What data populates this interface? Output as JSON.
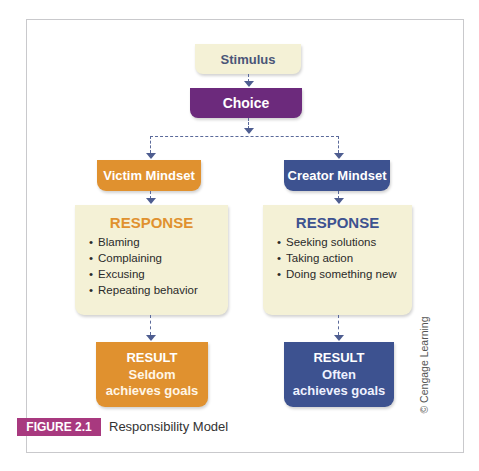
{
  "diagram": {
    "title": "Responsibility Model",
    "figure_label": "FIGURE 2.1",
    "copyright": "© Cengage Learning",
    "nodes": {
      "stimulus": "Stimulus",
      "choice": "Choice",
      "victim_mindset": "Victim Mindset",
      "creator_mindset": "Creator Mindset"
    },
    "victim": {
      "response_title": "RESPONSE",
      "responses": [
        "Blaming",
        "Complaining",
        "Excusing",
        "Repeating behavior"
      ],
      "result_title": "RESULT",
      "result_line1": "Seldom",
      "result_line2": "achieves goals"
    },
    "creator": {
      "response_title": "RESPONSE",
      "responses": [
        "Seeking solutions",
        "Taking action",
        "Doing something new"
      ],
      "result_title": "RESULT",
      "result_line1": "Often",
      "result_line2": "achieves goals"
    },
    "colors": {
      "stimulus_bg": "#f4f1d6",
      "choice_bg": "#6c2a7c",
      "victim": "#e0912f",
      "creator": "#3d5290",
      "response_bg": "#f4f1d6",
      "figure_badge": "#a8397f",
      "connector": "#5b6a9a"
    },
    "edges": [
      [
        "Stimulus",
        "Choice"
      ],
      [
        "Choice",
        "Victim Mindset"
      ],
      [
        "Choice",
        "Creator Mindset"
      ],
      [
        "Victim Mindset",
        "Victim Response"
      ],
      [
        "Creator Mindset",
        "Creator Response"
      ],
      [
        "Victim Response",
        "Victim Result"
      ],
      [
        "Creator Response",
        "Creator Result"
      ]
    ]
  }
}
